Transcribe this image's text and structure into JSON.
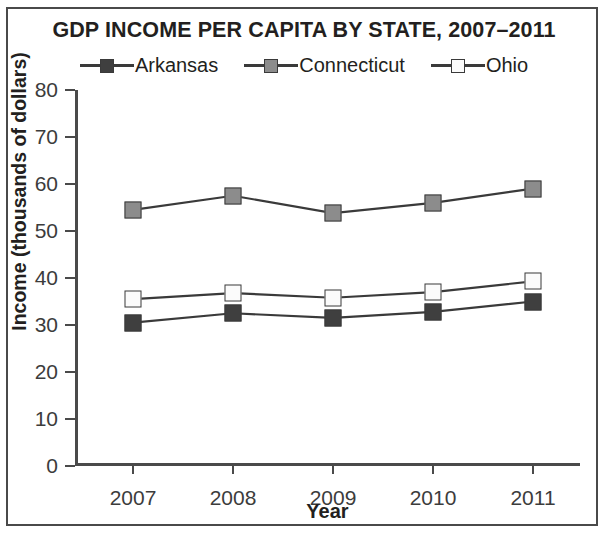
{
  "chart_data": {
    "type": "line",
    "title": "GDP INCOME PER CAPITA BY STATE, 2007–2011",
    "xlabel": "Year",
    "ylabel": "Income (thousands of dollars)",
    "categories": [
      "2007",
      "2008",
      "2009",
      "2010",
      "2011"
    ],
    "ylim": [
      0,
      80
    ],
    "yticks": [
      "0",
      "10",
      "20",
      "30",
      "40",
      "50",
      "60",
      "70",
      "80"
    ],
    "ytick_values": [
      0,
      10,
      20,
      30,
      40,
      50,
      60,
      70,
      80
    ],
    "grid": false,
    "legend_position": "top",
    "series": [
      {
        "name": "Arkansas",
        "values": [
          30.5,
          32.5,
          31.5,
          32.8,
          35.0
        ],
        "marker": "square",
        "marker_fill": "#3f3f3f",
        "line_color": "#3a3a3a"
      },
      {
        "name": "Connecticut",
        "values": [
          54.5,
          57.5,
          53.8,
          56.0,
          59.0
        ],
        "marker": "square",
        "marker_fill": "#8c8c8c",
        "line_color": "#3a3a3a"
      },
      {
        "name": "Ohio",
        "values": [
          35.5,
          36.8,
          35.8,
          37.0,
          39.3
        ],
        "marker": "square",
        "marker_fill": "#fbfbfb",
        "line_color": "#3a3a3a"
      }
    ]
  }
}
